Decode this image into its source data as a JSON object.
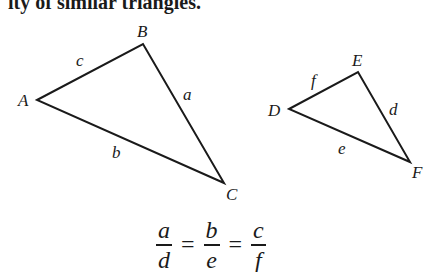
{
  "heading": {
    "text": "ity of similar triangles."
  },
  "triangles": [
    {
      "name": "ABC",
      "vertices": [
        {
          "label": "A",
          "x": 37,
          "y": 100
        },
        {
          "label": "B",
          "x": 143,
          "y": 44
        },
        {
          "label": "C",
          "x": 224,
          "y": 183
        }
      ],
      "sides": [
        {
          "label": "c",
          "between": "A-B"
        },
        {
          "label": "a",
          "between": "B-C"
        },
        {
          "label": "b",
          "between": "A-C"
        }
      ]
    },
    {
      "name": "DEF",
      "vertices": [
        {
          "label": "D",
          "x": 289,
          "y": 109
        },
        {
          "label": "E",
          "x": 358,
          "y": 72
        },
        {
          "label": "F",
          "x": 410,
          "y": 162
        }
      ],
      "sides": [
        {
          "label": "f",
          "between": "D-E"
        },
        {
          "label": "d",
          "between": "E-F"
        },
        {
          "label": "e",
          "between": "D-F"
        }
      ]
    }
  ],
  "labels": {
    "A": "A",
    "B": "B",
    "C": "C",
    "a": "a",
    "b": "b",
    "c": "c",
    "D": "D",
    "E": "E",
    "F": "F",
    "d": "d",
    "e": "e",
    "f": "f"
  },
  "equation": {
    "fractions": [
      {
        "numerator": "a",
        "denominator": "d"
      },
      {
        "numerator": "b",
        "denominator": "e"
      },
      {
        "numerator": "c",
        "denominator": "f"
      }
    ],
    "operator": "="
  },
  "colors": {
    "stroke": "#1a1a1a",
    "background": "#ffffff"
  }
}
